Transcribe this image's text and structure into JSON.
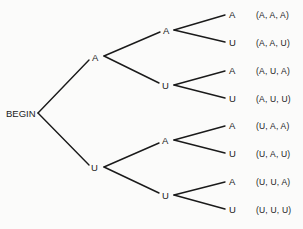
{
  "diagram": {
    "type": "probability-tree",
    "root": {
      "label": "BEGIN"
    },
    "level1": [
      {
        "label": "A"
      },
      {
        "label": "U"
      }
    ],
    "level2": [
      {
        "label": "A"
      },
      {
        "label": "U"
      },
      {
        "label": "A"
      },
      {
        "label": "U"
      }
    ],
    "leaves": [
      {
        "label": "A",
        "outcome": "(A, A, A)"
      },
      {
        "label": "U",
        "outcome": "(A, A, U)"
      },
      {
        "label": "A",
        "outcome": "(A, U, A)"
      },
      {
        "label": "U",
        "outcome": "(A, U, U)"
      },
      {
        "label": "A",
        "outcome": "(U, A, A)"
      },
      {
        "label": "U",
        "outcome": "(U, A, U)"
      },
      {
        "label": "A",
        "outcome": "(U, U, A)"
      },
      {
        "label": "U",
        "outcome": "(U, U, U)"
      }
    ],
    "line_color": "#1a1a1a"
  }
}
